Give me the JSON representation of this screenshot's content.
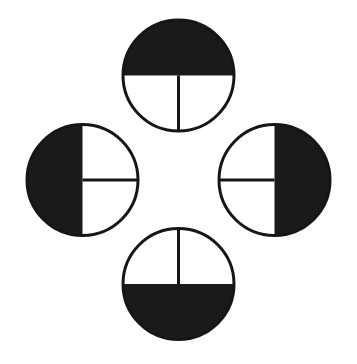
{
  "figure": {
    "canvas": {
      "width": 357,
      "height": 364,
      "background_color": "#ffffff"
    },
    "style": {
      "ink_color": "#161616",
      "fill_color": "#1a1a1a",
      "paper_color": "#ffffff",
      "outline_width": 3.0,
      "divider_width": 3.0
    },
    "layout": {
      "arrangement": "cross",
      "center_x": 178.5,
      "center_y": 180,
      "orbit_radius": 123,
      "circle_radius": 55.5
    },
    "circles": [
      {
        "name": "top-circle",
        "position": "top",
        "cx": 178.5,
        "cy": 75.5,
        "r": 55.5,
        "shaded_half": "upper",
        "shaded_half_label": "top half black",
        "divider_orientation": "vertical",
        "divider_direction": "down",
        "divider_from": "center",
        "divider_to": "bottom edge",
        "white_half": "lower"
      },
      {
        "name": "right-circle",
        "position": "right",
        "cx": 274.5,
        "cy": 180,
        "r": 55.5,
        "shaded_half": "right",
        "shaded_half_label": "right half black",
        "divider_orientation": "horizontal",
        "divider_direction": "left",
        "divider_from": "center",
        "divider_to": "left edge",
        "white_half": "left"
      },
      {
        "name": "bottom-circle",
        "position": "bottom",
        "cx": 178.5,
        "cy": 284,
        "r": 55.5,
        "shaded_half": "lower",
        "shaded_half_label": "bottom half black",
        "divider_orientation": "vertical",
        "divider_direction": "up",
        "divider_from": "center",
        "divider_to": "top edge",
        "white_half": "upper"
      },
      {
        "name": "left-circle",
        "position": "left",
        "cx": 82.5,
        "cy": 180,
        "r": 55.5,
        "shaded_half": "left",
        "shaded_half_label": "left half black",
        "divider_orientation": "horizontal",
        "divider_direction": "right",
        "divider_from": "center",
        "divider_to": "right edge",
        "white_half": "right"
      }
    ]
  }
}
